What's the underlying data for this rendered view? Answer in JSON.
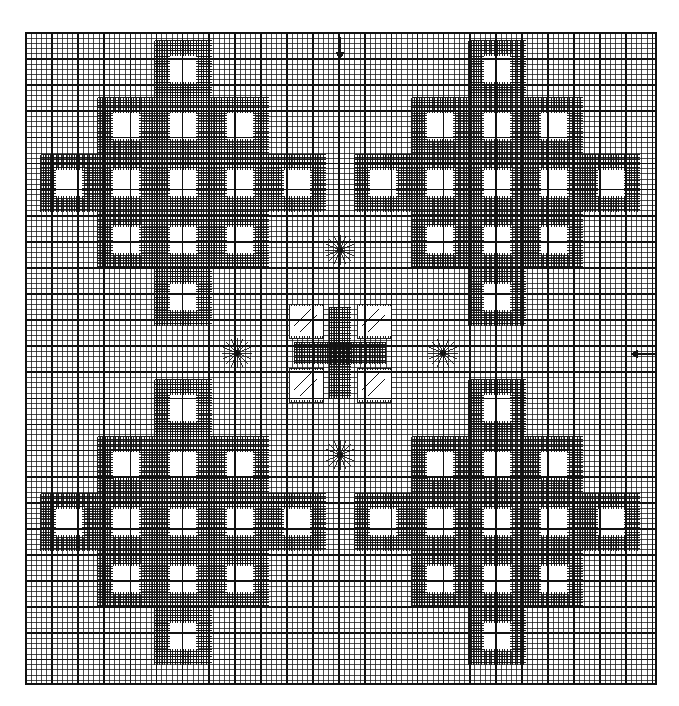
{
  "figure": {
    "header_faint_text": "",
    "background_color": "#ffffff",
    "line_color": "#111111",
    "cell_fill_color": "#ffffff",
    "grid": {
      "x0": 26,
      "y0": 33,
      "x1": 656,
      "y1": 684,
      "base_cell_px": 5.22,
      "major_every_cells": 5,
      "base_line_width": 0.75,
      "major_line_width": 1.7,
      "refined_line_width": 1.15,
      "cols": 121,
      "rows": 125
    },
    "annotations": {
      "arrow_top": {
        "name": "inflow-arrow-top",
        "direction": "down",
        "x": 340,
        "y": 48,
        "length": 22,
        "head": 7
      },
      "arrow_right": {
        "name": "inflow-arrow-right",
        "direction": "left",
        "x": 644,
        "y": 354,
        "length": 26,
        "head": 7
      }
    },
    "singularities": {
      "label": "radial burst nodes",
      "ray_count": 16,
      "ray_radius": 15,
      "points": [
        {
          "name": "north-node",
          "x": 340,
          "y": 250
        },
        {
          "name": "west-node",
          "x": 237,
          "y": 353
        },
        {
          "name": "east-node",
          "x": 443,
          "y": 353
        },
        {
          "name": "south-node",
          "x": 340,
          "y": 455
        }
      ]
    },
    "center_block": {
      "name": "central-cross",
      "cx": 340,
      "cy": 353,
      "half_span": 46,
      "arm_half_width": 11,
      "quad_squares": [
        {
          "name": "center-cell-nw",
          "dx": -34,
          "dy": -32,
          "size": 34,
          "hatch": "diag-up"
        },
        {
          "name": "center-cell-ne",
          "dx": 34,
          "dy": -32,
          "size": 34,
          "hatch": "diag-up"
        },
        {
          "name": "center-cell-sw",
          "dx": -34,
          "dy": 32,
          "size": 34,
          "hatch": "diag-up"
        },
        {
          "name": "center-cell-se",
          "dx": 34,
          "dy": 32,
          "size": 34,
          "hatch": "diag-up"
        }
      ]
    },
    "clusters": {
      "label": "refined diamond clusters (one per quadrant)",
      "cluster_centers": [
        {
          "name": "cluster-top-left",
          "cx": 183,
          "cy": 183
        },
        {
          "name": "cluster-top-right",
          "cx": 497,
          "cy": 183
        },
        {
          "name": "cluster-bottom-left",
          "cx": 183,
          "cy": 522
        },
        {
          "name": "cluster-bottom-right",
          "cx": 497,
          "cy": 522
        }
      ],
      "pitch": 57,
      "hole_size": 31,
      "diamond_offsets": [
        {
          "i": 0,
          "j": -2
        },
        {
          "i": -1,
          "j": -1
        },
        {
          "i": 0,
          "j": -1
        },
        {
          "i": 1,
          "j": -1
        },
        {
          "i": -2,
          "j": 0
        },
        {
          "i": -1,
          "j": 0
        },
        {
          "i": 0,
          "j": 0
        },
        {
          "i": 1,
          "j": 0
        },
        {
          "i": 2,
          "j": 0
        },
        {
          "i": -1,
          "j": 1
        },
        {
          "i": 0,
          "j": 1
        },
        {
          "i": 1,
          "j": 1
        },
        {
          "i": 0,
          "j": 2
        }
      ]
    },
    "refinement_bands": {
      "label": "dense hatch bands between coarse holes",
      "hatch_pitch": 2.6,
      "hatch_line_width": 0.95
    }
  }
}
